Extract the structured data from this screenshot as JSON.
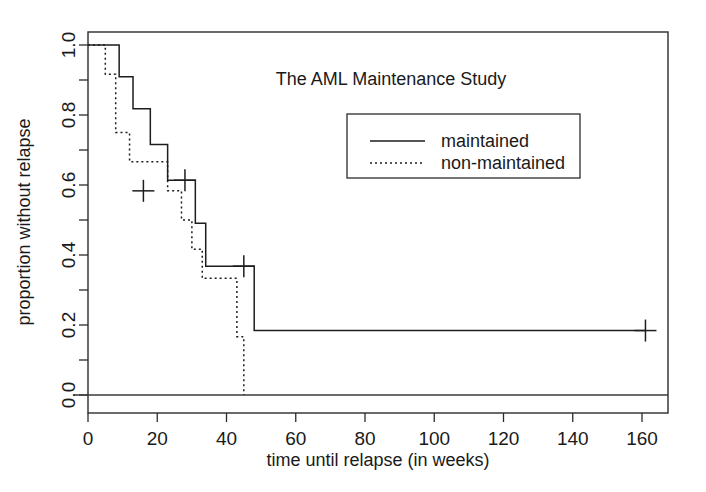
{
  "chart_data": {
    "type": "line",
    "title": "The AML Maintenance Study",
    "xlabel": "time until relapse (in weeks)",
    "ylabel": "proportion without relapse",
    "xlim": [
      0,
      168
    ],
    "ylim": [
      0.0,
      1.0
    ],
    "xticks": [
      0,
      20,
      40,
      60,
      80,
      100,
      120,
      140,
      160
    ],
    "xtick_labels": [
      "0",
      "20",
      "40",
      "60",
      "80",
      "100",
      "120",
      "140",
      "160"
    ],
    "yticks": [
      0.0,
      0.2,
      0.4,
      0.6,
      0.8,
      1.0
    ],
    "ytick_labels": [
      "0.0",
      "0.2",
      "0.4",
      "0.6",
      "0.8",
      "1.0"
    ],
    "yticks_minor": [
      0.1,
      0.3,
      0.5,
      0.7,
      0.9
    ],
    "grid": false,
    "legend_position": "center-right",
    "baseline_y": 0.0,
    "series": [
      {
        "name": "maintained",
        "style": "solid",
        "color": "#1d1d1d",
        "steps": [
          {
            "t": 0,
            "surv": 1.0
          },
          {
            "t": 9,
            "surv": 0.9091
          },
          {
            "t": 13,
            "surv": 0.8182
          },
          {
            "t": 18,
            "surv": 0.7159
          },
          {
            "t": 23,
            "surv": 0.6136
          },
          {
            "t": 31,
            "surv": 0.4909
          },
          {
            "t": 34,
            "surv": 0.3682
          },
          {
            "t": 48,
            "surv": 0.1841
          },
          {
            "t": 161,
            "surv": 0.1841
          }
        ],
        "censored": [
          {
            "t": 28,
            "surv": 0.6136
          },
          {
            "t": 45,
            "surv": 0.3682
          },
          {
            "t": 161,
            "surv": 0.1841
          }
        ]
      },
      {
        "name": "non-maintained",
        "style": "dotted",
        "color": "#1d1d1d",
        "steps": [
          {
            "t": 0,
            "surv": 1.0
          },
          {
            "t": 5,
            "surv": 0.9167
          },
          {
            "t": 8,
            "surv": 0.75
          },
          {
            "t": 12,
            "surv": 0.6667
          },
          {
            "t": 23,
            "surv": 0.5833
          },
          {
            "t": 27,
            "surv": 0.5
          },
          {
            "t": 30,
            "surv": 0.4167
          },
          {
            "t": 33,
            "surv": 0.3333
          },
          {
            "t": 43,
            "surv": 0.1667
          },
          {
            "t": 45,
            "surv": 0.0
          }
        ],
        "censored": [
          {
            "t": 16,
            "surv": 0.5833
          }
        ]
      }
    ],
    "legend_entries": [
      {
        "label": "maintained",
        "style": "solid"
      },
      {
        "label": "non-maintained",
        "style": "dotted"
      }
    ]
  }
}
